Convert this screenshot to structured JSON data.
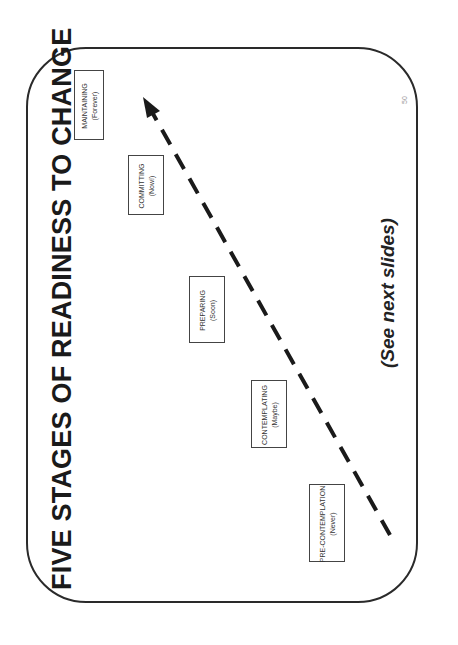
{
  "slide": {
    "title": "FIVE STAGES OF READINESS TO CHANGE",
    "footnote": "(See next slides)",
    "page_number": "50",
    "orientation": "rotated-90-ccw"
  },
  "stages": [
    {
      "name": "PRE-CONTEMPLATION",
      "timing": "(Never)"
    },
    {
      "name": "CONTEMPLATING",
      "timing": "(Maybe)"
    },
    {
      "name": "PREPARING",
      "timing": "(Soon)"
    },
    {
      "name": "COMMITTING",
      "timing": "(Now!)"
    },
    {
      "name": "MAINTAINING",
      "timing": "(Forever)"
    }
  ],
  "arrow": {
    "style": "dashed",
    "direction": "from PRE-CONTEMPLATION toward MAINTAINING",
    "color": "#1a1a1a"
  },
  "colors": {
    "border": "#2a2a2a",
    "text": "#1a1a1a",
    "background": "#ffffff"
  }
}
